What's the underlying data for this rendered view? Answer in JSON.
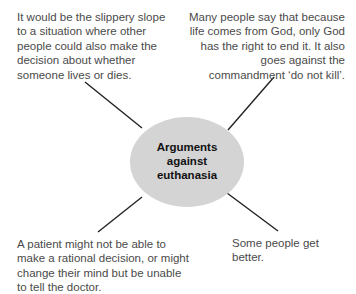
{
  "diagram": {
    "center": {
      "line1": "Arguments",
      "line2": "against",
      "line3": "euthanasia",
      "fill_color": "#d4d4d4"
    },
    "arguments": [
      {
        "position": "top-left",
        "text": "It would be the slippery slope to a situation where other people could also make the decision about whether someone lives or dies."
      },
      {
        "position": "top-right",
        "text": "Many people say that because life comes from God, only God has the right to end it. It also goes against the commandment ‘do not kill’."
      },
      {
        "position": "bottom-left",
        "text": "A patient might not be able to make a rational decision, or might change their mind but be unable to tell the doctor."
      },
      {
        "position": "bottom-right",
        "text": "Some people get better."
      }
    ],
    "line_color": "#222222",
    "text_color": "#4a4a4a"
  }
}
